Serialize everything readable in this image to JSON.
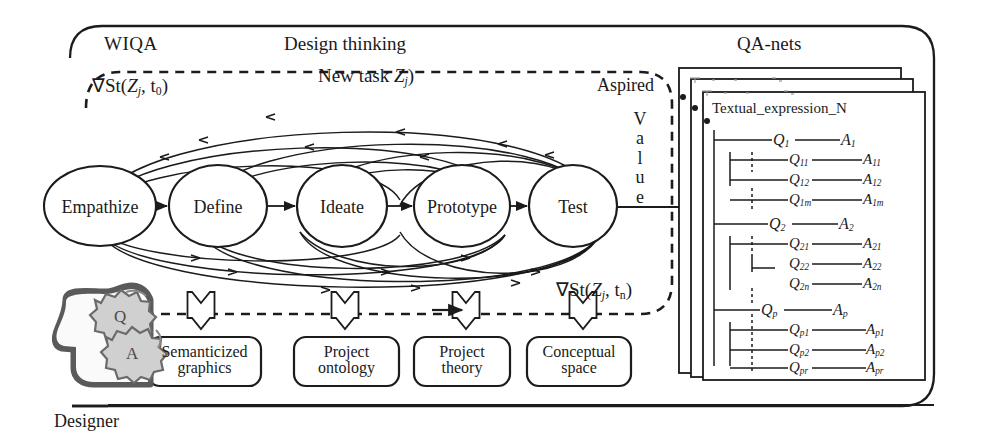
{
  "diagram": {
    "colors": {
      "ink": "#1a1a1a",
      "paper": "#ffffff",
      "gear": "#b9b9b9",
      "head": "#6f6f6f"
    }
  },
  "frames": {
    "outer_label": "WIQA",
    "dashed_label": "Design thinking",
    "qa_panel_label": "QA-nets",
    "card_label": "Textual_expression_N"
  },
  "annotations": {
    "grad_start": {
      "op": "∇St(",
      "task": "Z",
      "task_sub": "j",
      "comma": ", t",
      "time_sub": "0",
      "close": ")"
    },
    "grad_end": {
      "op": "∇St(",
      "task": "Z",
      "task_sub": "j",
      "comma": ", t",
      "time_sub": "n",
      "close": ")"
    },
    "new_task": {
      "text": "New task ",
      "task": "Z",
      "task_sub": "j",
      "close": ")"
    },
    "aspired": "Aspired",
    "value_vertical": [
      "V",
      "a",
      "l",
      "u",
      "e"
    ]
  },
  "process": {
    "stages": [
      {
        "id": "empathize",
        "label": "Empathize"
      },
      {
        "id": "define",
        "label": "Define"
      },
      {
        "id": "ideate",
        "label": "Ideate"
      },
      {
        "id": "prototype",
        "label": "Prototype"
      },
      {
        "id": "test",
        "label": "Test"
      }
    ]
  },
  "designer": {
    "caption": "Designer",
    "gears": [
      "Q",
      "A"
    ]
  },
  "resources": {
    "boxes": [
      {
        "id": "semanticized-graphics",
        "line1": "Semanticized",
        "line2": "graphics"
      },
      {
        "id": "project-ontology",
        "line1": "Project",
        "line2": "ontology"
      },
      {
        "id": "project-theory",
        "line1": "Project",
        "line2": "theory"
      },
      {
        "id": "conceptual-space",
        "line1": "Conceptual",
        "line2": "space"
      }
    ]
  },
  "qa_net": {
    "rows": [
      {
        "level": 0,
        "q": "Q",
        "q_sub": "1",
        "a": "A",
        "a_sub": "1"
      },
      {
        "level": 1,
        "q": "Q",
        "q_sub": "11",
        "a": "A",
        "a_sub": "11"
      },
      {
        "level": 1,
        "q": "Q",
        "q_sub": "12",
        "a": "A",
        "a_sub": "12"
      },
      {
        "level": 1,
        "q": "Q",
        "q_sub": "1m",
        "a": "A",
        "a_sub": "1m"
      },
      {
        "level": 0,
        "q": "Q",
        "q_sub": "2",
        "a": "A",
        "a_sub": "2"
      },
      {
        "level": 1,
        "q": "Q",
        "q_sub": "21",
        "a": "A",
        "a_sub": "21"
      },
      {
        "level": 1,
        "q": "Q",
        "q_sub": "22",
        "a": "A",
        "a_sub": "22"
      },
      {
        "level": 1,
        "q": "Q",
        "q_sub": "2n",
        "a": "A",
        "a_sub": "2n"
      },
      {
        "level": 0,
        "q": "Q",
        "q_sub": "p",
        "a": "A",
        "a_sub": "p"
      },
      {
        "level": 1,
        "q": "Q",
        "q_sub": "p1",
        "a": "A",
        "a_sub": "p1"
      },
      {
        "level": 1,
        "q": "Q",
        "q_sub": "p2",
        "a": "A",
        "a_sub": "p2"
      },
      {
        "level": 1,
        "q": "Q",
        "q_sub": "pr",
        "a": "A",
        "a_sub": "pr"
      }
    ]
  }
}
